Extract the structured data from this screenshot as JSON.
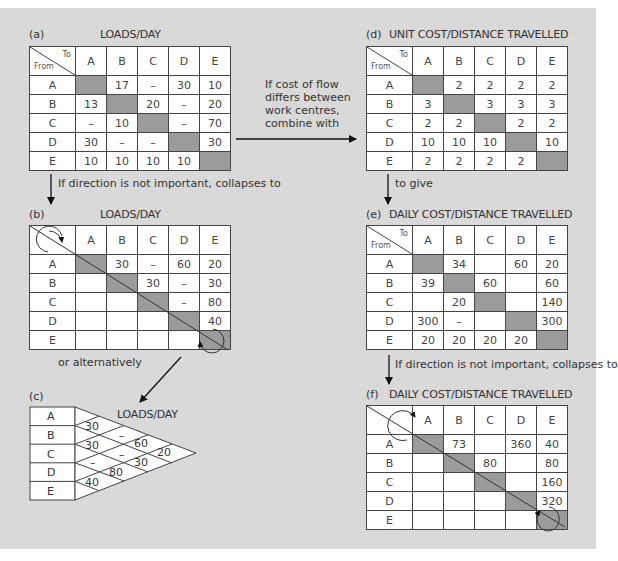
{
  "columns": [
    "A",
    "B",
    "C",
    "D",
    "E"
  ],
  "rows": [
    "A",
    "B",
    "C",
    "D",
    "E"
  ],
  "corner": {
    "to": "To",
    "from": "From"
  },
  "panel_a": {
    "tag": "(a)",
    "title": "LOADS/DAY",
    "cells": [
      [
        "",
        "17",
        "–",
        "30",
        "10"
      ],
      [
        "13",
        "",
        "20",
        "–",
        "20"
      ],
      [
        "–",
        "10",
        "",
        "–",
        "70"
      ],
      [
        "30",
        "–",
        "–",
        "",
        "30"
      ],
      [
        "10",
        "10",
        "10",
        "10",
        ""
      ]
    ]
  },
  "panel_b": {
    "tag": "(b)",
    "title": "LOADS/DAY",
    "cells": [
      [
        "",
        "30",
        "–",
        "60",
        "20"
      ],
      [
        "",
        "",
        "30",
        "–",
        "30"
      ],
      [
        "",
        "",
        "",
        "–",
        "80"
      ],
      [
        "",
        "",
        "",
        "",
        "40"
      ],
      [
        "",
        "",
        "",
        "",
        ""
      ]
    ]
  },
  "panel_c": {
    "tag": "(c)",
    "title": "LOADS/DAY",
    "pairs": {
      "AB": "30",
      "BC": "30",
      "CD": "–",
      "DE": "40",
      "AC": "–",
      "BD": "–",
      "CE": "80",
      "AD": "60",
      "BE": "30",
      "AE": "20"
    }
  },
  "panel_d": {
    "tag": "(d)",
    "title": "UNIT COST/DISTANCE TRAVELLED",
    "cells": [
      [
        "",
        "2",
        "2",
        "2",
        "2"
      ],
      [
        "3",
        "",
        "3",
        "3",
        "3"
      ],
      [
        "2",
        "2",
        "",
        "2",
        "2"
      ],
      [
        "10",
        "10",
        "10",
        "",
        "10"
      ],
      [
        "2",
        "2",
        "2",
        "2",
        ""
      ]
    ]
  },
  "panel_e": {
    "tag": "(e)",
    "title": "DAILY COST/DISTANCE TRAVELLED",
    "cells": [
      [
        "",
        "34",
        "",
        "60",
        "20"
      ],
      [
        "39",
        "",
        "60",
        "",
        "60"
      ],
      [
        "",
        "20",
        "",
        "",
        "140"
      ],
      [
        "300",
        "–",
        "",
        "",
        "300"
      ],
      [
        "20",
        "20",
        "20",
        "20",
        ""
      ]
    ]
  },
  "panel_f": {
    "tag": "(f)",
    "title": "DAILY COST/DISTANCE TRAVELLED",
    "cells": [
      [
        "",
        "73",
        "",
        "360",
        "40"
      ],
      [
        "",
        "",
        "80",
        "",
        "80"
      ],
      [
        "",
        "",
        "",
        "",
        "160"
      ],
      [
        "",
        "",
        "",
        "",
        "320"
      ],
      [
        "",
        "",
        "",
        "",
        ""
      ]
    ]
  },
  "notes": {
    "a_to_b": "If direction is not important, collapses to",
    "a_to_d": "If cost of flow differs between work centres, combine with",
    "d_to_e": "to give",
    "e_to_f": "If direction is not important, collapses to",
    "b_to_c": "or alternatively"
  },
  "colors": {
    "background": "#d9d9d9",
    "shade": "#9b9b9b",
    "line": "#444444"
  }
}
